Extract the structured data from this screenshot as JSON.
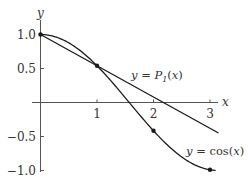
{
  "chart_data": {
    "type": "line",
    "title": "",
    "xlabel": "x",
    "ylabel": "y",
    "xlim": [
      0,
      3.2
    ],
    "ylim": [
      -1.05,
      1.1
    ],
    "grid": false,
    "x_ticks": [
      {
        "value": 1,
        "label": "1"
      },
      {
        "value": 2,
        "label": "2"
      },
      {
        "value": 3,
        "label": "3"
      }
    ],
    "y_ticks": [
      {
        "value": 1.0,
        "label": "1.0"
      },
      {
        "value": 0.5,
        "label": "0.5"
      },
      {
        "value": -0.5,
        "label": "−0.5"
      },
      {
        "value": -1.0,
        "label": "−1.0"
      }
    ],
    "series": [
      {
        "name": "y = cos(x)",
        "label_prefix": "y = cos(",
        "label_var": "x",
        "label_suffix": ")",
        "kind": "curve",
        "function": "cos",
        "x_range": [
          0,
          3.1
        ],
        "marked_points": [
          {
            "x": 0,
            "y": 1.0
          },
          {
            "x": 1,
            "y": 0.5403
          },
          {
            "x": 2,
            "y": -0.4161
          },
          {
            "x": 3,
            "y": -0.99
          }
        ]
      },
      {
        "name": "y = P1(x)",
        "label_prefix": "y = P",
        "label_sub": "1",
        "label_suffix_open": "(",
        "label_var": "x",
        "label_suffix": ")",
        "kind": "line",
        "points": [
          {
            "x": 0,
            "y": 1.0
          },
          {
            "x": 1,
            "y": 0.5403
          },
          {
            "x": 3.15,
            "y": -0.448
          }
        ]
      }
    ],
    "annotations": [
      "y = P1(x)",
      "y = cos(x)"
    ]
  },
  "colors": {
    "curve": "#1a1a1a",
    "axis": "#555555",
    "text": "#333333"
  }
}
